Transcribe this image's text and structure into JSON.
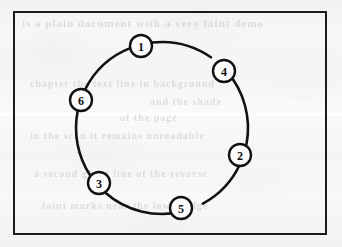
{
  "figure": {
    "kind": "circle-node-diagram",
    "background_color": "#f5f5f5",
    "ink_color": "#121212",
    "node_fill_color": "#fcfcfc",
    "frame": {
      "x": 13,
      "y": 11,
      "width": 314,
      "height": 224,
      "border_width": 2
    },
    "ghost_text": [
      {
        "text": "is a plain  document with  a  very  faint  demo",
        "x": 22,
        "y": 17,
        "size": 11
      },
      {
        "text": "chapter  the   text  line  in  background",
        "x": 30,
        "y": 78,
        "size": 10
      },
      {
        "text": "and  the  shade",
        "x": 150,
        "y": 96,
        "size": 10
      },
      {
        "text": "of  the  page",
        "x": 120,
        "y": 112,
        "size": 10
      },
      {
        "text": "in  the  scan  it  remains  unreadable",
        "x": 30,
        "y": 130,
        "size": 10
      },
      {
        "text": "a  second  ghost  line  of  the  reverse",
        "x": 34,
        "y": 168,
        "size": 10
      },
      {
        "text": "faint  marks  near  the  lower  edge",
        "x": 42,
        "y": 200,
        "size": 10
      }
    ]
  },
  "chart_data": {
    "type": "scatter",
    "title": "",
    "subtitle": "",
    "xlabel": "",
    "ylabel": "",
    "grid": false,
    "legend_position": "none",
    "geometry": {
      "center_x": 162,
      "center_y": 128,
      "radius": 86,
      "node_radius": 11,
      "stroke_width": 2.6
    },
    "categories": [
      "1",
      "4",
      "2",
      "5",
      "3",
      "6"
    ],
    "nodes": [
      {
        "label": "1",
        "angle_deg": 256,
        "x": 141,
        "y": 46
      },
      {
        "label": "4",
        "angle_deg": 312,
        "x": 224,
        "y": 71
      },
      {
        "label": "2",
        "angle_deg": 18,
        "x": 240,
        "y": 155
      },
      {
        "label": "5",
        "angle_deg": 69,
        "x": 181,
        "y": 208
      },
      {
        "label": "3",
        "angle_deg": 139,
        "x": 99,
        "y": 183
      },
      {
        "label": "6",
        "angle_deg": 199,
        "x": 81,
        "y": 100
      }
    ],
    "values": [
      256,
      312,
      18,
      69,
      139,
      199
    ]
  }
}
